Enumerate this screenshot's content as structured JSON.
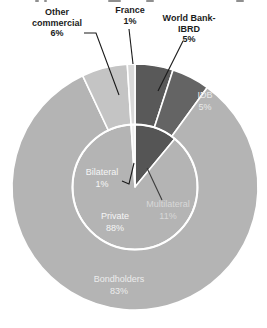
{
  "chart_data": {
    "type": "pie",
    "subtype": "nested-donut",
    "units": "%",
    "title": "",
    "legend": "none",
    "rings": [
      {
        "name": "outer",
        "radius_role": "outer-ring",
        "start_angle_deg": 0,
        "direction": "clockwise",
        "segments": [
          {
            "label": "World Bank-IBRD",
            "value": 5,
            "color": "#595959"
          },
          {
            "label": "IDB",
            "value": 5,
            "color": "#646464"
          },
          {
            "label": "Bondholders",
            "value": 83,
            "color": "#b4b4b4"
          },
          {
            "label": "Other commercial",
            "value": 6,
            "color": "#c4c4c4"
          },
          {
            "label": "France",
            "value": 1,
            "color": "#d9d9d9"
          }
        ]
      },
      {
        "name": "inner",
        "radius_role": "inner-pie",
        "start_angle_deg": 0,
        "direction": "clockwise",
        "segments": [
          {
            "label": "Multilateral",
            "value": 11,
            "color": "#555555"
          },
          {
            "label": "Private",
            "value": 88,
            "color": "#b4b4b4"
          },
          {
            "label": "Bilateral",
            "value": 1,
            "color": "#efefef"
          }
        ]
      }
    ]
  },
  "labels": {
    "other_commercial": "Other\ncommercial\n6%",
    "france": "France\n1%",
    "world_bank": "World Bank-\nIBRD\n5%",
    "idb": "IDB\n5%",
    "bilateral": "Bilateral\n1%",
    "multilateral": "Multilateral\n11%",
    "private": "Private\n88%",
    "bondholders": "Bondholders\n83%"
  },
  "colors": {
    "background": "#ffffff",
    "segment_divider": "#ffffff",
    "callout_text": "#1c1c1c",
    "inner_label_text": "#f6f6f6",
    "leader_line": "#1a1a1a"
  }
}
